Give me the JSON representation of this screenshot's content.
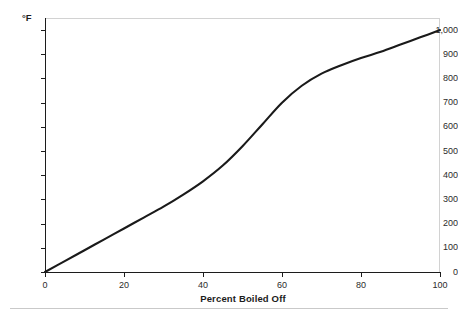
{
  "chart_data": {
    "type": "line",
    "title": "",
    "xlabel": "Percent Boiled Off",
    "ylabel": "°F",
    "xlim": [
      0,
      100
    ],
    "ylim": [
      0,
      1050
    ],
    "grid": false,
    "legend": "none",
    "x_ticks": [
      "0",
      "20",
      "40",
      "60",
      "80",
      "100"
    ],
    "x_tick_values": [
      0,
      20,
      40,
      60,
      80,
      100
    ],
    "y_ticks": [
      "0",
      "100",
      "200",
      "300",
      "400",
      "500",
      "600",
      "700",
      "800",
      "900",
      "1,000"
    ],
    "y_tick_values": [
      0,
      100,
      200,
      300,
      400,
      500,
      600,
      700,
      800,
      900,
      1000
    ],
    "series": [
      {
        "name": "Distillation curve",
        "color": "#1a1a1a",
        "x": [
          0,
          5,
          10,
          15,
          20,
          25,
          30,
          35,
          40,
          45,
          50,
          55,
          60,
          65,
          70,
          75,
          80,
          85,
          90,
          95,
          100
        ],
        "values": [
          0,
          45,
          90,
          135,
          180,
          225,
          270,
          320,
          375,
          440,
          520,
          610,
          700,
          770,
          820,
          855,
          885,
          910,
          940,
          970,
          1000
        ]
      }
    ]
  },
  "axes": {
    "y_unit_label": "°F",
    "x_title": "Percent Boiled Off"
  }
}
